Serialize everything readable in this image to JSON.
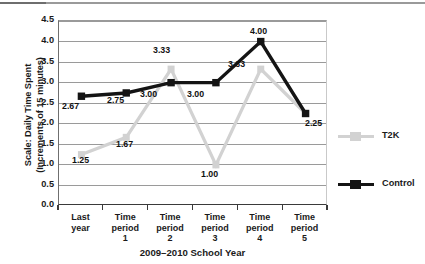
{
  "chart_data": {
    "type": "line",
    "title": "",
    "xlabel": "2009–2010 School Year",
    "ylabel_line1": "Scale: Daily Time Spent",
    "ylabel_line2": "(Increments of 15 minutes)",
    "categories": [
      "Last year",
      "Time period 1",
      "Time period 2",
      "Time period 3",
      "Time period 4",
      "Time period 5"
    ],
    "category_lines": [
      [
        "Last",
        "year"
      ],
      [
        "Time",
        "period",
        "1"
      ],
      [
        "Time",
        "period",
        "2"
      ],
      [
        "Time",
        "period",
        "3"
      ],
      [
        "Time",
        "period",
        "4"
      ],
      [
        "Time",
        "period",
        "5"
      ]
    ],
    "ylim": [
      0.0,
      4.5
    ],
    "ytick_step": 0.5,
    "ytick_labels": [
      "4.5",
      "4.0",
      "3.5",
      "3.0",
      "2.5",
      "2.0",
      "1.5",
      "1.0",
      "0.5",
      "0.0"
    ],
    "grid": true,
    "legend_position": "right",
    "series": [
      {
        "name": "T2K",
        "color": "#d2d2d2",
        "values": [
          1.25,
          1.67,
          3.33,
          1.0,
          3.33,
          2.25
        ],
        "labels": [
          "1.25",
          "1.67",
          "3.33",
          "1.00",
          "3.33",
          ""
        ]
      },
      {
        "name": "Control",
        "color": "#141414",
        "values": [
          2.67,
          2.75,
          3.0,
          3.0,
          4.0,
          2.25
        ],
        "labels": [
          "2.67",
          "2.75",
          "3.00",
          "3.00",
          "4.00",
          "2.25"
        ]
      }
    ]
  },
  "legend": {
    "items": [
      {
        "label": "T2K",
        "color": "#d2d2d2"
      },
      {
        "label": "Control",
        "color": "#141414"
      }
    ]
  },
  "value_labels": [
    {
      "text": "2.67",
      "x": 62,
      "y": 102
    },
    {
      "text": "2.75",
      "x": 107,
      "y": 96
    },
    {
      "text": "3.00",
      "x": 140,
      "y": 90
    },
    {
      "text": "3.00",
      "x": 187,
      "y": 90
    },
    {
      "text": "4.00",
      "x": 250,
      "y": 27
    },
    {
      "text": "2.25",
      "x": 305,
      "y": 119
    },
    {
      "text": "1.25",
      "x": 72,
      "y": 156
    },
    {
      "text": "1.67",
      "x": 116,
      "y": 140
    },
    {
      "text": "3.33",
      "x": 153,
      "y": 46
    },
    {
      "text": "1.00",
      "x": 201,
      "y": 170
    },
    {
      "text": "3.33",
      "x": 228,
      "y": 60
    }
  ]
}
